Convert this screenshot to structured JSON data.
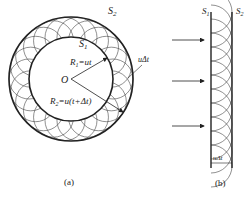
{
  "figure_a": {
    "caption": "(a)",
    "outer_surface_label": "S",
    "outer_surface_sub": "2",
    "inner_surface_label": "S",
    "inner_surface_sub": "1",
    "center_label": "O",
    "r1_label": "R",
    "r1_sub": "1",
    "r1_eq": "=ut",
    "r2_label": "R",
    "r2_sub": "2",
    "r2_eq": "=u(t+Δt)",
    "gap_label": "uΔt"
  },
  "figure_b": {
    "caption": "(b)",
    "left_surface_label": "S",
    "left_surface_sub": "1",
    "right_surface_label": "S",
    "right_surface_sub": "2",
    "width_label": "uΔt"
  },
  "colors": {
    "stroke": "#222222",
    "background": "#ffffff"
  }
}
